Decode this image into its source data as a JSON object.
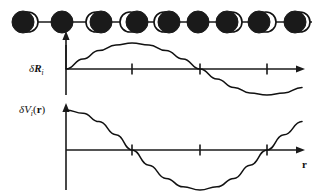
{
  "figure": {
    "background_color": "#ffffff",
    "ink_color": "#1a1a1a"
  },
  "chain": {
    "name": "atomic-chain",
    "baseline_y": 22,
    "atom_radius": 11,
    "hollow_radius": 10,
    "equilibrium_positions": [
      28,
      62,
      96,
      130,
      164,
      198,
      232,
      266,
      300
    ],
    "displacements": [
      -5,
      0,
      5,
      7,
      5,
      0,
      -5,
      -7,
      -5
    ],
    "atom_count": 9
  },
  "plot_top": {
    "name": "displacement-plot",
    "ylabel": {
      "delta": "δ",
      "symbol": "R",
      "subscript": "i"
    },
    "axis_origin_x": 66,
    "axis_baseline_y": 69,
    "axis_end_x": 302,
    "axis_top_y": 43,
    "axis_bottom_y": 95,
    "ticks": [
      132,
      200,
      267
    ],
    "pointer_arrow_x": 66
  },
  "plot_bottom": {
    "name": "potential-plot",
    "ylabel": {
      "delta": "δ",
      "symbol": "V",
      "subscript": "i",
      "open_paren": "(",
      "argument": "r",
      "close_paren": ")"
    },
    "xlabel": "r",
    "axis_origin_x": 66,
    "axis_baseline_y": 150,
    "axis_end_x": 302,
    "axis_top_y": 103,
    "axis_bottom_y": 190,
    "ticks": [
      132,
      200,
      267
    ]
  },
  "chart_data": [
    {
      "type": "line",
      "name": "displacement-wave",
      "title": "",
      "xlabel": "",
      "ylabel": "δR_i",
      "description": "Sine wave of atomic displacement versus position along the chain",
      "x": [
        66,
        83,
        99,
        116,
        132,
        149,
        166,
        183,
        200,
        217,
        234,
        250,
        267,
        284,
        302
      ],
      "values": [
        0.0,
        0.38,
        0.71,
        0.92,
        1.0,
        0.92,
        0.71,
        0.38,
        0.0,
        -0.38,
        -0.71,
        -0.92,
        -1.0,
        -0.92,
        -0.71
      ],
      "amplitude": 26,
      "zero_crossings": [
        66,
        200
      ],
      "maximum_x": 132,
      "minimum_x": 267,
      "grid": false,
      "legend": "none"
    },
    {
      "type": "line",
      "name": "potential-wave",
      "title": "",
      "xlabel": "r",
      "ylabel": "δV_i(r)",
      "description": "Cosine wave of perturbation potential versus position",
      "x": [
        66,
        83,
        99,
        116,
        132,
        149,
        166,
        183,
        200,
        217,
        234,
        250,
        267,
        284,
        302
      ],
      "values": [
        1.0,
        0.92,
        0.71,
        0.38,
        0.0,
        -0.38,
        -0.71,
        -0.92,
        -1.0,
        -0.92,
        -0.71,
        -0.38,
        0.0,
        0.38,
        0.71
      ],
      "amplitude": 40,
      "zero_crossings": [
        132,
        267
      ],
      "maximum_x": 66,
      "minimum_x": 200,
      "grid": false,
      "legend": "none"
    }
  ]
}
